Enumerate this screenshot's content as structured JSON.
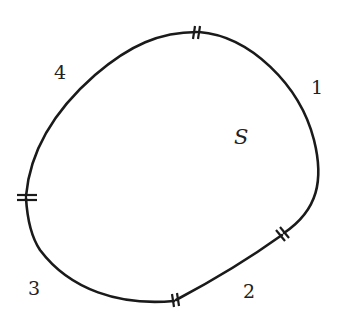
{
  "diagram": {
    "region_label": "S",
    "segments": [
      {
        "id": 1,
        "label": "1"
      },
      {
        "id": 2,
        "label": "2"
      },
      {
        "id": 3,
        "label": "3"
      },
      {
        "id": 4,
        "label": "4"
      }
    ],
    "break_marks": [
      "top",
      "right-lower",
      "bottom",
      "left"
    ],
    "colors": {
      "stroke": "#1a1a1a",
      "background": "#ffffff"
    }
  }
}
